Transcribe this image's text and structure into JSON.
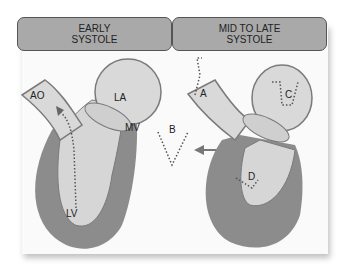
{
  "headers": {
    "left": {
      "line1": "EARLY",
      "line2": "SYSTOLE"
    },
    "right": {
      "line1": "MID TO LATE",
      "line2": "SYSTOLE"
    }
  },
  "left_diagram": {
    "labels": {
      "aorta": "AO",
      "left_atrium": "LA",
      "mitral_valve": "MV",
      "left_ventricle": "LV"
    }
  },
  "center": {
    "label": "B"
  },
  "right_diagram": {
    "labels": {
      "a": "A",
      "c": "C",
      "d": "D"
    }
  },
  "colors": {
    "myocardium": "#8c8c8c",
    "chamber": "#d6d6d6",
    "outline": "#7a7a7a",
    "header_fill": "#a9a9a9",
    "dots": "#555555"
  }
}
